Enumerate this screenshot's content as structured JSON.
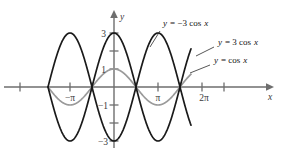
{
  "figure": {
    "type": "math-graph",
    "background": "#ffffff",
    "axes": {
      "x_axis_label": "x",
      "y_axis_label": "y",
      "x_tick_labels": [
        "−π",
        "π",
        "2π"
      ],
      "y_tick_labels": [
        "3",
        "1",
        "−1",
        "−3"
      ],
      "x_ticks_unlabeled_count": 5,
      "y_ticks_unlabeled_count": 2,
      "axis_color": "#6e6e6e"
    },
    "annotations": [
      {
        "id": "neg3cos",
        "text_parts": [
          "y",
          " = −3 cos ",
          "x"
        ],
        "full": "y = −3 cos x",
        "color": "#111111"
      },
      {
        "id": "pos3cos",
        "text_parts": [
          "y",
          " = 3 cos ",
          "x"
        ],
        "full": "y = 3 cos x",
        "color": "#111111"
      },
      {
        "id": "cos",
        "text_parts": [
          "y",
          " = cos ",
          "x"
        ],
        "full": "y = cos x",
        "color": "#111111"
      }
    ]
  },
  "chart_data": {
    "type": "line",
    "title": "",
    "xlabel": "x",
    "ylabel": "y",
    "xlim": [
      -4.71238898038469,
      5.497787143782138
    ],
    "ylim": [
      -3.6,
      3.6
    ],
    "grid": false,
    "legend": "inline-annotations-right",
    "x_tick_values": [
      -4.71238898,
      -3.14159265,
      -1.57079633,
      0,
      1.57079633,
      3.14159265,
      4.71238898,
      5.49778714
    ],
    "x_tick_text": [
      "",
      "−π",
      "",
      "",
      "",
      "π",
      "",
      "2π"
    ],
    "y_tick_values": [
      3,
      2,
      1,
      -1,
      -2,
      -3
    ],
    "y_tick_text": [
      "3",
      "",
      "1",
      "−1",
      "",
      "−3"
    ],
    "series": [
      {
        "name": "y = 3 cos x",
        "expression": "3*cos(x)",
        "amplitude": 3,
        "period": 6.283185307,
        "color": "#1a1a1a",
        "style": "solid",
        "key_points": [
          {
            "x": -3.14159265,
            "y": -3
          },
          {
            "x": -1.57079633,
            "y": 0
          },
          {
            "x": 0,
            "y": 3
          },
          {
            "x": 1.57079633,
            "y": 0
          },
          {
            "x": 3.14159265,
            "y": -3
          },
          {
            "x": 4.71238898,
            "y": 0
          },
          {
            "x": 6.28318531,
            "y": 3
          }
        ]
      },
      {
        "name": "y = −3 cos x",
        "expression": "-3*cos(x)",
        "amplitude": 3,
        "period": 6.283185307,
        "color": "#1a1a1a",
        "style": "solid",
        "key_points": [
          {
            "x": -3.14159265,
            "y": 3
          },
          {
            "x": -1.57079633,
            "y": 0
          },
          {
            "x": 0,
            "y": -3
          },
          {
            "x": 1.57079633,
            "y": 0
          },
          {
            "x": 3.14159265,
            "y": 3
          },
          {
            "x": 4.71238898,
            "y": 0
          },
          {
            "x": 6.28318531,
            "y": -3
          }
        ]
      },
      {
        "name": "y = cos x",
        "expression": "cos(x)",
        "amplitude": 1,
        "period": 6.283185307,
        "color": "#9a9a9a",
        "style": "solid",
        "key_points": [
          {
            "x": -3.14159265,
            "y": -1
          },
          {
            "x": -1.57079633,
            "y": 0
          },
          {
            "x": 0,
            "y": 1
          },
          {
            "x": 1.57079633,
            "y": 0
          },
          {
            "x": 3.14159265,
            "y": -1
          },
          {
            "x": 4.71238898,
            "y": 0
          },
          {
            "x": 6.28318531,
            "y": 1
          }
        ]
      }
    ]
  },
  "labels": {
    "y_var": "y",
    "x_var": "x",
    "tick_neg_pi": "−π",
    "tick_pi": "π",
    "tick_2pi": "2π",
    "tick_3": "3",
    "tick_1": "1",
    "tick_neg1": "−1",
    "tick_neg3": "−3",
    "eq_neg3cos_lhs": "y",
    "eq_neg3cos_rhs": "= −3 cos",
    "eq_neg3cos_var": "x",
    "eq_3cos_lhs": "y",
    "eq_3cos_rhs": "= 3 cos",
    "eq_3cos_var": "x",
    "eq_cos_lhs": "y",
    "eq_cos_rhs": "= cos",
    "eq_cos_var": "x"
  }
}
